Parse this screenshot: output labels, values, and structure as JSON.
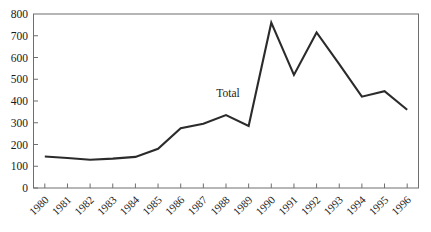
{
  "chart_data": {
    "type": "line",
    "title": "",
    "subtitle": "",
    "xlabel": "",
    "ylabel": "",
    "categories": [
      "1980",
      "1981",
      "1982",
      "1983",
      "1984",
      "1985",
      "1986",
      "1987",
      "1988",
      "1989",
      "1990",
      "1991",
      "1992",
      "1993",
      "1994",
      "1995",
      "1996"
    ],
    "series": [
      {
        "name": "Total",
        "values": [
          145,
          138,
          130,
          135,
          143,
          180,
          275,
          295,
          335,
          285,
          760,
          520,
          715,
          570,
          420,
          445,
          360
        ],
        "color": "#2b2b2b"
      }
    ],
    "annotations": [
      {
        "text": "Total",
        "x_category": "1988",
        "y_value": 420
      }
    ],
    "ylim": [
      0,
      800
    ],
    "ytick_values": [
      0,
      100,
      200,
      300,
      400,
      500,
      600,
      700,
      800
    ],
    "ytick_labels": [
      "0",
      "100",
      "200",
      "300",
      "400",
      "500",
      "600",
      "700",
      "800"
    ],
    "xtick_labels": [
      "1980",
      "1981",
      "1982",
      "1983",
      "1984",
      "1985",
      "1986",
      "1987",
      "1988",
      "1989",
      "1990",
      "1991",
      "1992",
      "1993",
      "1994",
      "1995",
      "1996"
    ],
    "xtick_rotation_degrees": -45,
    "grid": false,
    "legend": "none",
    "frame": "full-rectangle",
    "tick_direction": "in"
  },
  "style": {
    "background_color": "#ffffff",
    "axis_color": "#6e6e6e",
    "text_color": "#1a1a1a",
    "line_color": "#2b2b2b",
    "line_width": 2.1
  }
}
